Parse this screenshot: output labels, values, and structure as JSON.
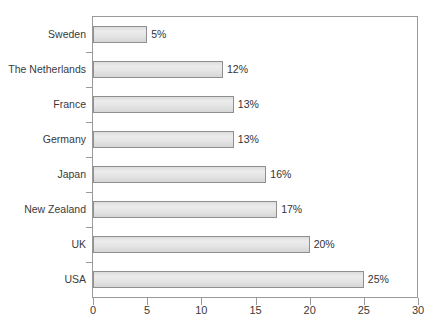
{
  "chart_data": {
    "type": "bar",
    "orientation": "horizontal",
    "title": "",
    "subtitle": "",
    "xlabel": "",
    "ylabel": "",
    "xlim": [
      0,
      30
    ],
    "xticks": [
      0,
      5,
      10,
      15,
      20,
      25,
      30
    ],
    "xtick_labels": [
      "0",
      "5",
      "10",
      "15",
      "20",
      "25",
      "30"
    ],
    "grid": false,
    "legend": false,
    "legend_position": "none",
    "categories": [
      "Sweden",
      "The Netherlands",
      "France",
      "Germany",
      "Japan",
      "New Zealand",
      "UK",
      "USA"
    ],
    "values": [
      5,
      12,
      13,
      13,
      16,
      17,
      20,
      25
    ],
    "value_labels": [
      "5%",
      "12%",
      "13%",
      "13%",
      "16%",
      "17%",
      "20%",
      "25%"
    ],
    "bars": [
      {
        "category": "Sweden",
        "value": 5,
        "label": "5%"
      },
      {
        "category": "The Netherlands",
        "value": 12,
        "label": "12%"
      },
      {
        "category": "France",
        "value": 13,
        "label": "13%"
      },
      {
        "category": "Germany",
        "value": 13,
        "label": "13%"
      },
      {
        "category": "Japan",
        "value": 16,
        "label": "16%"
      },
      {
        "category": "New Zealand",
        "value": 17,
        "label": "17%"
      },
      {
        "category": "UK",
        "value": 20,
        "label": "20%"
      },
      {
        "category": "USA",
        "value": 25,
        "label": "25%"
      }
    ]
  },
  "style": {
    "bar_fill": "#e6e6e6",
    "bar_border": "#8f8f8f",
    "axis_color": "#9a9a9a",
    "text_color": "#3a3a3a",
    "background": "#ffffff"
  }
}
